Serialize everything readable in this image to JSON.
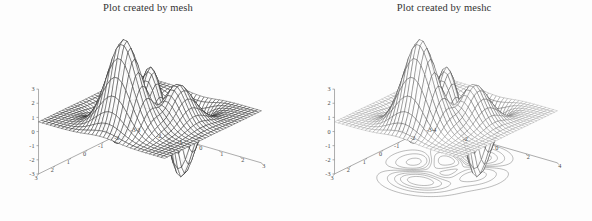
{
  "figure": {
    "background_color": "#fdfdfd",
    "axis_color": "#8a8a8a",
    "mesh_color": "#1a1a1a",
    "contour_color": "#555555",
    "tick_label_color": "#4a4a4a",
    "title_color": "#333333"
  },
  "panels": [
    {
      "id": "mesh",
      "title": "Plot created by mesh",
      "command": "mesh",
      "has_contour": false,
      "axes": {
        "x_ticks": [
          "3",
          "2",
          "1",
          "0",
          "-1",
          "-2",
          "-3"
        ],
        "y_ticks": [
          "-3",
          "-2",
          "-1",
          "0",
          "1",
          "2",
          "3"
        ],
        "z_ticks": [
          "3",
          "2",
          "1",
          "0",
          "-1",
          "-2",
          "-3"
        ],
        "xlim": [
          -3,
          3
        ],
        "ylim": [
          -3,
          3
        ],
        "zlim": [
          -3,
          3
        ]
      }
    },
    {
      "id": "meshc",
      "title": "Plot created by meshc",
      "command": "meshc",
      "has_contour": true,
      "axes": {
        "x_ticks": [
          "3",
          "2",
          "1",
          "0",
          "-1",
          "-2",
          "-3"
        ],
        "y_ticks": [
          "-4",
          "-2",
          "0",
          "2",
          "4"
        ],
        "z_ticks": [
          "3",
          "2",
          "1",
          "0",
          "-1",
          "-2",
          "-3"
        ],
        "xlim": [
          -3,
          3
        ],
        "ylim": [
          -4,
          4
        ],
        "zlim": [
          -3,
          3
        ]
      }
    }
  ],
  "chart_data": {
    "type": "surface",
    "surface_function": "peaks",
    "formula": "z = 3*(1-x)^2*exp(-x^2-(y+1)^2) - 10*(x/5 - x^3 - y^5)*exp(-x^2-y^2) - (1/3)*exp(-(x+1)^2 - y^2)",
    "grid_n": 34,
    "xlabel": "",
    "ylabel": "",
    "zlabel": "",
    "xlim": [
      -3,
      3
    ],
    "ylim": [
      -3,
      3
    ],
    "zlim": [
      -3,
      3
    ],
    "grid": false,
    "legend": "none",
    "view_azimuth": -37.5,
    "view_elevation": 30,
    "z_min_approx": -6.5,
    "z_max_approx": 8.1,
    "contour_levels": 10,
    "series": [
      {
        "name": "Plot created by mesh",
        "renderer": "mesh",
        "contour_base": false,
        "x_ticks": [
          3,
          2,
          1,
          0,
          -1,
          -2,
          -3
        ],
        "y_ticks": [
          -3,
          -2,
          -1,
          0,
          1,
          2,
          3
        ],
        "z_ticks": [
          3,
          2,
          1,
          0,
          -1,
          -2,
          -3
        ]
      },
      {
        "name": "Plot created by meshc",
        "renderer": "meshc",
        "contour_base": true,
        "x_ticks": [
          3,
          2,
          1,
          0,
          -1,
          -2,
          -3
        ],
        "y_ticks": [
          -4,
          -2,
          0,
          2,
          4
        ],
        "z_ticks": [
          3,
          2,
          1,
          0,
          -1,
          -2,
          -3
        ]
      }
    ]
  }
}
